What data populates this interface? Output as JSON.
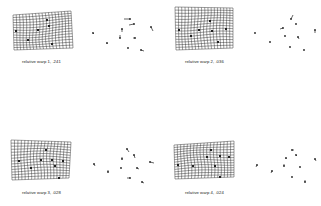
{
  "figure": {
    "panels": [
      {
        "id": 1,
        "caption": "relative warp 1, .241",
        "grid": {
          "x": 13,
          "y": 11,
          "w": 58,
          "h": 39,
          "skew_top": -4,
          "skew_right": 2,
          "cols": 18,
          "rows": 14
        },
        "landmarks": [
          [
            47,
            20
          ],
          [
            49,
            26
          ],
          [
            38,
            30
          ],
          [
            28,
            40
          ],
          [
            52,
            44
          ],
          [
            16,
            31
          ]
        ],
        "vectors": [
          [
            130,
            19,
            -6,
            0
          ],
          [
            134,
            24,
            -5,
            1
          ],
          [
            151,
            27,
            2,
            4
          ],
          [
            122,
            29,
            0,
            3
          ],
          [
            93,
            33,
            1,
            1
          ],
          [
            120,
            38,
            0,
            -3
          ],
          [
            135,
            38,
            -2,
            0
          ],
          [
            107,
            43,
            0,
            1
          ],
          [
            128,
            48,
            0,
            0
          ],
          [
            141,
            50,
            3,
            1
          ]
        ]
      },
      {
        "id": 2,
        "caption": "relative warp 2, .036",
        "grid": {
          "x": 175,
          "y": 7,
          "w": 58,
          "h": 43,
          "skew_top": 1,
          "skew_right": 0,
          "cols": 18,
          "rows": 15
        },
        "landmarks": [
          [
            210,
            21
          ],
          [
            199,
            30
          ],
          [
            212,
            31
          ],
          [
            191,
            36
          ],
          [
            218,
            42
          ],
          [
            179,
            30
          ],
          [
            226,
            29
          ]
        ],
        "vectors": [
          [
            291,
            19,
            2,
            -4
          ],
          [
            296,
            24,
            0,
            0
          ],
          [
            283,
            28,
            -3,
            1
          ],
          [
            285,
            36,
            0,
            0
          ],
          [
            298,
            37,
            1,
            2
          ],
          [
            255,
            33,
            0,
            0
          ],
          [
            270,
            42,
            0,
            0
          ],
          [
            290,
            47,
            0,
            0
          ],
          [
            304,
            50,
            0,
            0
          ],
          [
            315,
            30,
            0,
            3
          ]
        ]
      },
      {
        "id": 3,
        "caption": "relative warp 3, .028",
        "grid": {
          "x": 11,
          "y": 140,
          "w": 60,
          "h": 40,
          "skew_top": 2,
          "skew_right": -2,
          "cols": 18,
          "rows": 14
        },
        "landmarks": [
          [
            46,
            150
          ],
          [
            41,
            160
          ],
          [
            52,
            160
          ],
          [
            31,
            168
          ],
          [
            55,
            166
          ],
          [
            19,
            161
          ],
          [
            63,
            161
          ],
          [
            59,
            178
          ]
        ],
        "vectors": [
          [
            127,
            149,
            2,
            3
          ],
          [
            134,
            155,
            1,
            3
          ],
          [
            122,
            159,
            0,
            -2
          ],
          [
            121,
            168,
            0,
            0
          ],
          [
            137,
            168,
            2,
            1
          ],
          [
            94,
            164,
            1,
            2
          ],
          [
            108,
            172,
            0,
            -2
          ],
          [
            130,
            178,
            -3,
            0
          ],
          [
            142,
            182,
            2,
            1
          ],
          [
            150,
            162,
            4,
            1
          ]
        ]
      },
      {
        "id": 4,
        "caption": "relative warp 4, .024",
        "grid": {
          "x": 174,
          "y": 141,
          "w": 60,
          "h": 38,
          "skew_top": -4,
          "skew_right": 0,
          "cols": 18,
          "rows": 14
        },
        "landmarks": [
          [
            211,
            150
          ],
          [
            207,
            157
          ],
          [
            220,
            156
          ],
          [
            193,
            166
          ],
          [
            215,
            166
          ],
          [
            178,
            165
          ],
          [
            229,
            157
          ],
          [
            220,
            177
          ]
        ],
        "vectors": [
          [
            292,
            150,
            2,
            0
          ],
          [
            296,
            155,
            1,
            1
          ],
          [
            286,
            158,
            0,
            1
          ],
          [
            284,
            166,
            0,
            -2
          ],
          [
            300,
            167,
            0,
            0
          ],
          [
            257,
            165,
            -1,
            2
          ],
          [
            272,
            171,
            -1,
            2
          ],
          [
            292,
            177,
            0,
            0
          ],
          [
            305,
            182,
            0,
            -2
          ],
          [
            315,
            159,
            1,
            2
          ]
        ]
      }
    ],
    "colors": {
      "ink": "#222222",
      "background": "#ffffff"
    }
  }
}
